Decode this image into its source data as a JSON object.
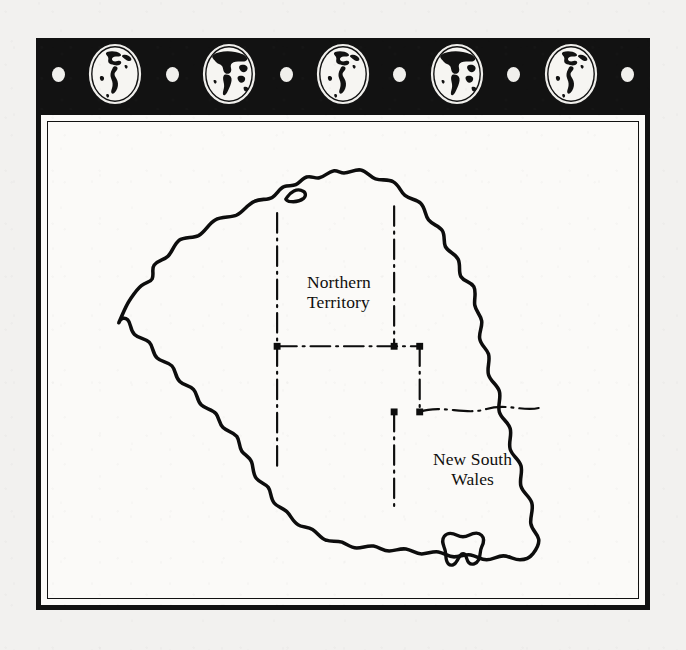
{
  "plate": {
    "title": "Australia",
    "background_color": "#f2f1ef",
    "frame_color": "#111111",
    "panel_color": "#fbfaf8"
  },
  "ornament_band": {
    "background_color": "#121212",
    "dot_color": "#f0efec",
    "items": [
      {
        "type": "dot",
        "icon": "dot-icon"
      },
      {
        "type": "globe",
        "icon": "globe-americas-icon",
        "hemisphere": "Americas"
      },
      {
        "type": "dot",
        "icon": "dot-icon"
      },
      {
        "type": "globe",
        "icon": "globe-eurafrica-icon",
        "hemisphere": "Africa-Eurasia"
      },
      {
        "type": "dot",
        "icon": "dot-icon"
      },
      {
        "type": "globe",
        "icon": "globe-americas-icon",
        "hemisphere": "Americas"
      },
      {
        "type": "dot",
        "icon": "dot-icon"
      },
      {
        "type": "globe",
        "icon": "globe-eurafrica-icon",
        "hemisphere": "Africa-Eurasia"
      },
      {
        "type": "dot",
        "icon": "dot-icon"
      },
      {
        "type": "globe",
        "icon": "globe-americas-icon",
        "hemisphere": "Americas"
      },
      {
        "type": "dot",
        "icon": "dot-icon"
      }
    ]
  },
  "map": {
    "subject": "Australia",
    "coastline_color": "#0d0d0d",
    "border_style": "dash-dot",
    "islands": [
      "Tasmania"
    ],
    "labels": [
      {
        "id": "northern-territory",
        "text": "Northern\nTerritory"
      },
      {
        "id": "new-south-wales",
        "text": "New South\nWales"
      }
    ]
  }
}
